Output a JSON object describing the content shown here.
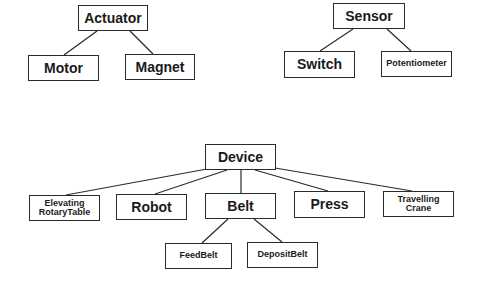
{
  "diagram": {
    "type": "class-hierarchy",
    "trees": [
      {
        "root": "Actuator",
        "children": [
          "Motor",
          "Magnet"
        ]
      },
      {
        "root": "Sensor",
        "children": [
          "Switch",
          "Potentiometer"
        ]
      },
      {
        "root": "Device",
        "children": [
          "Elevating RotaryTable",
          "Robot",
          "Belt",
          "Press",
          "Travelling Crane"
        ]
      },
      {
        "root": "Belt",
        "children": [
          "FeedBelt",
          "DepositBelt"
        ]
      }
    ]
  },
  "nodes": {
    "actuator": "Actuator",
    "motor": "Motor",
    "magnet": "Magnet",
    "sensor": "Sensor",
    "switch": "Switch",
    "potentiometer": "Potentiometer",
    "device": "Device",
    "elevating_rotary_table": "Elevating\nRotaryTable",
    "robot": "Robot",
    "belt": "Belt",
    "press": "Press",
    "travelling_crane": "Travelling\nCrane",
    "feed_belt": "FeedBelt",
    "deposit_belt": "DepositBelt"
  },
  "colors": {
    "line": "#2a2a2a",
    "text": "#1a1a1a",
    "background": "#ffffff"
  }
}
